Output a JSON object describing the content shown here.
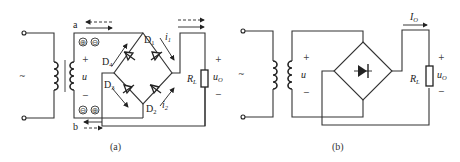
{
  "figure_a": {
    "caption": "(a)",
    "source_symbol": "~",
    "secondary_voltage": "u",
    "secondary_plus": "+",
    "secondary_minus": "−",
    "terminal_top": "a",
    "terminal_bottom": "b",
    "polarity_top": [
      "⊕",
      "⊖"
    ],
    "polarity_bottom": [
      "⊖",
      "⊕"
    ],
    "diodes": [
      {
        "label": "D",
        "sub": "1"
      },
      {
        "label": "D",
        "sub": "2"
      },
      {
        "label": "D",
        "sub": "3"
      },
      {
        "label": "D",
        "sub": "4"
      }
    ],
    "currents": [
      {
        "label": "i",
        "sub": "1"
      },
      {
        "label": "i",
        "sub": "2"
      }
    ],
    "load": {
      "label": "R",
      "sub": "L"
    },
    "output": {
      "label": "u",
      "sub": "O",
      "plus": "+",
      "minus": "−"
    }
  },
  "figure_b": {
    "caption": "(b)",
    "source_symbol": "~",
    "secondary_voltage": "u",
    "secondary_plus": "+",
    "secondary_minus": "−",
    "current": {
      "label": "I",
      "sub": "O"
    },
    "load": {
      "label": "R",
      "sub": "L"
    },
    "output": {
      "label": "u",
      "sub": "O",
      "plus": "+",
      "minus": "−"
    }
  }
}
